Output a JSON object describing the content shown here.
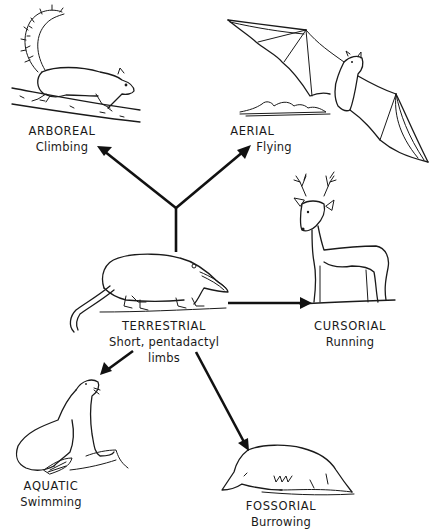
{
  "diagram": {
    "center": {
      "title": "TERRESTRIAL",
      "subtitle_line1": "Short, pentadactyl",
      "subtitle_line2": "limbs",
      "animal": "opossum-like shrew"
    },
    "nodes": [
      {
        "id": "arboreal",
        "title": "ARBOREAL",
        "subtitle": "Climbing",
        "animal": "squirrel"
      },
      {
        "id": "aerial",
        "title": "AERIAL",
        "subtitle": "Flying",
        "animal": "bat"
      },
      {
        "id": "cursorial",
        "title": "CURSORIAL",
        "subtitle": "Running",
        "animal": "deer"
      },
      {
        "id": "aquatic",
        "title": "AQUATIC",
        "subtitle": "Swimming",
        "animal": "sea lion"
      },
      {
        "id": "fossorial",
        "title": "FOSSORIAL",
        "subtitle": "Burrowing",
        "animal": "mole"
      }
    ],
    "edges": [
      {
        "from": "terrestrial",
        "to": "arboreal"
      },
      {
        "from": "terrestrial",
        "to": "aerial"
      },
      {
        "from": "terrestrial",
        "to": "cursorial"
      },
      {
        "from": "terrestrial",
        "to": "aquatic"
      },
      {
        "from": "terrestrial",
        "to": "fossorial"
      }
    ],
    "colors": {
      "ink": "#1a1a1a",
      "background": "#ffffff"
    }
  }
}
